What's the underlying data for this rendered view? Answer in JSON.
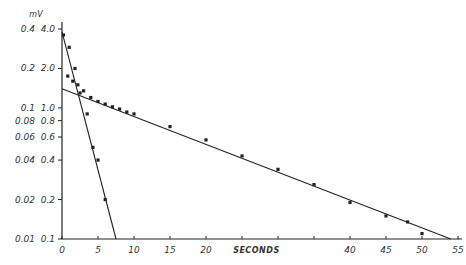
{
  "chart_data": {
    "type": "scatter",
    "title": "",
    "xlabel": "SECONDS",
    "ylabel_right_inner": "",
    "ylabel_outer_unit": "mV",
    "y_scale": "log",
    "xlim": [
      0,
      55
    ],
    "ylim": [
      0.1,
      4.0
    ],
    "x_ticks": [
      0,
      5,
      10,
      15,
      20,
      25,
      30,
      35,
      40,
      45,
      50,
      55
    ],
    "x_tick_labels": [
      "0",
      "5",
      "10",
      "15",
      "20",
      "",
      "",
      "",
      "40",
      "45",
      "50",
      "55"
    ],
    "y_ticks_inner": [
      4.0,
      2.0,
      1.0,
      0.8,
      0.6,
      0.4,
      0.2,
      0.1
    ],
    "y_tick_labels_inner": [
      "4.0",
      "2.0",
      "1.0",
      "0.8",
      "0.6",
      "0.4",
      "0.2",
      "0.1"
    ],
    "y_tick_labels_outer": [
      "0.4",
      "0.2",
      "0.1",
      "0.08",
      "0.06",
      "0.04",
      "0.02",
      "0.01"
    ],
    "grid": false,
    "series": [
      {
        "name": "fast component (fitted line)",
        "kind": "line",
        "x": [
          0,
          7.5
        ],
        "y": [
          3.8,
          0.1
        ]
      },
      {
        "name": "slow component (fitted line)",
        "kind": "line",
        "x": [
          0,
          54
        ],
        "y": [
          1.4,
          0.1
        ]
      },
      {
        "name": "observed data",
        "kind": "points",
        "x": [
          0.8,
          1.5,
          2.2,
          3.0,
          4.0,
          5.0,
          6.0,
          7.0,
          8.0,
          9.0,
          10.0,
          15.0,
          20.0,
          25.0,
          30.0,
          35.0,
          40.0,
          45.0,
          48.0,
          50.0
        ],
        "y": [
          1.75,
          1.6,
          1.5,
          1.35,
          1.2,
          1.12,
          1.07,
          1.02,
          0.98,
          0.93,
          0.9,
          0.72,
          0.57,
          0.43,
          0.34,
          0.26,
          0.19,
          0.15,
          0.135,
          0.11
        ]
      },
      {
        "name": "fast component (points)",
        "kind": "points",
        "x": [
          0.2,
          1.0,
          1.8,
          2.5,
          3.5,
          4.3,
          5.0,
          6.0
        ],
        "y": [
          3.6,
          2.9,
          2.0,
          1.3,
          0.9,
          0.5,
          0.4,
          0.2
        ]
      }
    ]
  },
  "axis": {
    "unit_label": "mV",
    "x_title": "SECONDS"
  }
}
